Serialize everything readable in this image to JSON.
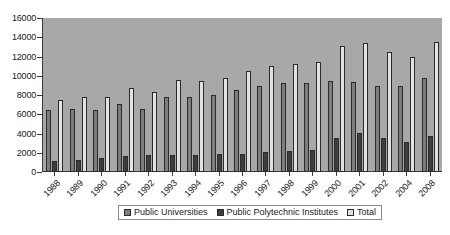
{
  "chart_data": {
    "type": "bar",
    "title": "",
    "subtitle": "",
    "xlabel": "",
    "ylabel": "",
    "ylim": [
      0,
      16000
    ],
    "ytick_step": 2000,
    "yticks": [
      "0",
      "2000",
      "4000",
      "6000",
      "8000",
      "10000",
      "12000",
      "14000",
      "16000"
    ],
    "grid": false,
    "legend_position": "bottom",
    "categories": [
      "1988",
      "1989",
      "1990",
      "1991",
      "1992",
      "1993",
      "1994",
      "1995",
      "1996",
      "1997",
      "1998",
      "1999",
      "2000",
      "2001",
      "2002",
      "2004",
      "2008"
    ],
    "series": [
      {
        "name": "Public Universities",
        "color": "#7d7d7d",
        "values": [
          6400,
          6500,
          6400,
          7100,
          6550,
          7800,
          7800,
          8000,
          8500,
          8900,
          9250,
          9250,
          9500,
          9400,
          8900,
          8900,
          9800
        ]
      },
      {
        "name": "Public Polytechnic Institutes",
        "color": "#3d3d3d",
        "values": [
          1100,
          1250,
          1500,
          1700,
          1800,
          1800,
          1750,
          1850,
          1900,
          2100,
          2200,
          2300,
          3550,
          4050,
          3550,
          3150,
          3750
        ]
      },
      {
        "name": "Total",
        "color": "#e2e2e2",
        "values": [
          7450,
          7750,
          7750,
          8750,
          8300,
          9550,
          9500,
          9800,
          10450,
          11000,
          11250,
          11450,
          13050,
          13400,
          12450,
          12000,
          13550
        ]
      }
    ]
  },
  "legend": {
    "items": [
      {
        "label": "Public Universities",
        "swatch": "universities"
      },
      {
        "label": "Public Polytechnic Institutes",
        "swatch": "polytechnic"
      },
      {
        "label": "Total",
        "swatch": "total"
      }
    ]
  },
  "colors": {
    "plot_background": "#a8a8a8",
    "page_background": "#ffffff",
    "axis": "#3a3a3a",
    "bar_outline": "#2b2b2b"
  }
}
